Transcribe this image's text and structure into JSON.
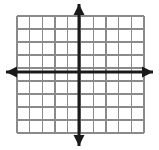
{
  "figure": {
    "background_color": "#ffffff"
  },
  "chart_data": {
    "type": "scatter",
    "title": "",
    "xlabel": "",
    "ylabel": "",
    "x": [],
    "y": [],
    "series": [],
    "annotations": [],
    "legend": null,
    "grid": true,
    "xlim": [
      -4,
      6
    ],
    "ylim": [
      -5,
      4
    ],
    "xticks": [
      -4,
      -3,
      -2,
      -1,
      0,
      1,
      2,
      3,
      4,
      5,
      6
    ],
    "yticks": [
      -5,
      -4,
      -3,
      -2,
      -1,
      0,
      1,
      2,
      3,
      4
    ],
    "xtick_labels": [],
    "ytick_labels": [],
    "tick_labels_visible": false
  },
  "geometry": {
    "canvas_width": 159,
    "canvas_height": 150,
    "grid_left": 17,
    "grid_right": 144,
    "grid_top": 16,
    "grid_bottom": 133,
    "cell_width": 12.7,
    "cell_height": 13.0,
    "vertical_line_count": 11,
    "horizontal_line_count": 10,
    "origin_x": 79,
    "origin_y": 72,
    "x_axis_start": 6,
    "x_axis_end": 153,
    "y_axis_start": 4,
    "y_axis_end": 146
  },
  "style": {
    "grid_line_color": "#8a8a8a",
    "grid_line_width": "1.3",
    "axis_color": "#1a1a1a",
    "axis_line_width": "3",
    "arrow_color": "#1a1a1a",
    "arrow_half_width": "5.5",
    "arrow_length": "11"
  },
  "elements": {
    "grid_name": "coordinate-grid",
    "x_axis_name": "x-axis",
    "y_axis_name": "y-axis",
    "arrow_left_name": "x-axis-left-arrowhead",
    "arrow_right_name": "x-axis-right-arrowhead",
    "arrow_up_name": "y-axis-up-arrowhead",
    "arrow_down_name": "y-axis-down-arrowhead",
    "origin_name": "origin-point"
  }
}
